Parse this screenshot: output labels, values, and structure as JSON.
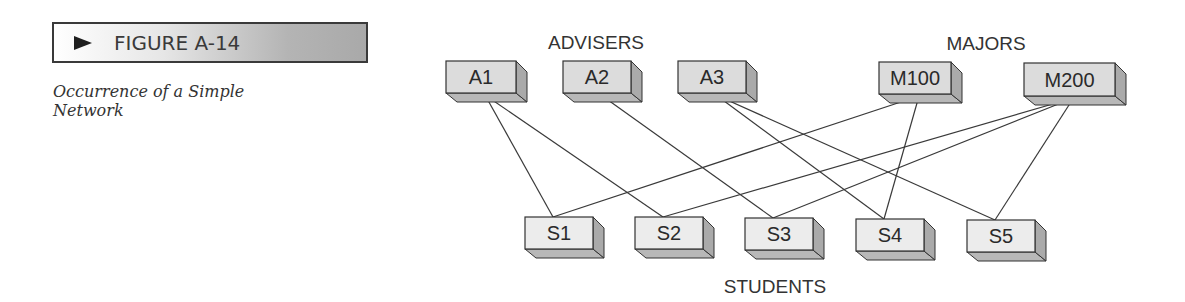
{
  "figure": {
    "label": "FIGURE A-14",
    "caption": "Occurrence of a Simple Network"
  },
  "groups": {
    "advisers": "ADVISERS",
    "majors": "MAJORS",
    "students": "STUDENTS"
  },
  "colors": {
    "box_front": "#dcdcdc",
    "box_side": "#aaaaaa",
    "box_bottom": "#b8b8b8",
    "student_front": "#ececec",
    "line": "#3a3a3a",
    "border": "#333333"
  },
  "nodes": [
    {
      "id": "A1",
      "label": "A1",
      "group": "advisers",
      "x": 446,
      "y": 61,
      "w": 70,
      "h": 32
    },
    {
      "id": "A2",
      "label": "A2",
      "group": "advisers",
      "x": 563,
      "y": 61,
      "w": 68,
      "h": 32
    },
    {
      "id": "A3",
      "label": "A3",
      "group": "advisers",
      "x": 678,
      "y": 61,
      "w": 68,
      "h": 32
    },
    {
      "id": "M100",
      "label": "M100",
      "group": "majors",
      "x": 879,
      "y": 62,
      "w": 72,
      "h": 32
    },
    {
      "id": "M200",
      "label": "M200",
      "group": "majors",
      "x": 1024,
      "y": 63,
      "w": 91,
      "h": 33
    },
    {
      "id": "S1",
      "label": "S1",
      "group": "students",
      "x": 525,
      "y": 217,
      "w": 68,
      "h": 32
    },
    {
      "id": "S2",
      "label": "S2",
      "group": "students",
      "x": 635,
      "y": 217,
      "w": 68,
      "h": 32
    },
    {
      "id": "S3",
      "label": "S3",
      "group": "students",
      "x": 745,
      "y": 218,
      "w": 68,
      "h": 32
    },
    {
      "id": "S4",
      "label": "S4",
      "group": "students",
      "x": 856,
      "y": 219,
      "w": 68,
      "h": 32
    },
    {
      "id": "S5",
      "label": "S5",
      "group": "students",
      "x": 967,
      "y": 220,
      "w": 68,
      "h": 32
    }
  ],
  "edges": [
    {
      "from": "A1",
      "to": "S1"
    },
    {
      "from": "A1",
      "to": "S2"
    },
    {
      "from": "A2",
      "to": "S3"
    },
    {
      "from": "A3",
      "to": "S4"
    },
    {
      "from": "A3",
      "to": "S5"
    },
    {
      "from": "M100",
      "to": "S1"
    },
    {
      "from": "M100",
      "to": "S4"
    },
    {
      "from": "M200",
      "to": "S2"
    },
    {
      "from": "M200",
      "to": "S3"
    },
    {
      "from": "M200",
      "to": "S5"
    }
  ]
}
